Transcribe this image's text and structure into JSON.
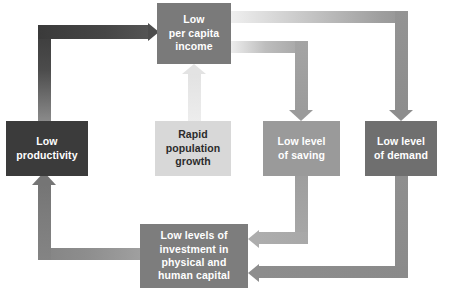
{
  "diagram": {
    "background": "#ffffff",
    "nodes": [
      {
        "id": "income",
        "label": "Low\nper capita\nincome",
        "text": "Low per capita income",
        "color": "#7a7a7a",
        "text_color": "#ffffff"
      },
      {
        "id": "productivity",
        "label": "Low\nproductivity",
        "text": "Low productivity",
        "color": "#3b3b3b",
        "text_color": "#ffffff"
      },
      {
        "id": "population",
        "label": "Rapid\npopulation\ngrowth",
        "text": "Rapid population growth",
        "color": "#d8d8d8",
        "text_color": "#2b2b2b"
      },
      {
        "id": "saving",
        "label": "Low level\nof saving",
        "text": "Low level of saving",
        "color": "#9a9a9a",
        "text_color": "#ffffff"
      },
      {
        "id": "demand",
        "label": "Low level\nof demand",
        "text": "Low level of demand",
        "color": "#6f6f6f",
        "text_color": "#ffffff"
      },
      {
        "id": "investment",
        "label": "Low levels of\ninvestment in\nphysical and\nhuman capital",
        "text": "Low levels of investment in physical and human capital",
        "color": "#7d7d7d",
        "text_color": "#ffffff"
      }
    ],
    "edges": [
      {
        "id": "a",
        "from": "productivity",
        "to": "income",
        "route": "up-then-right",
        "color": "#4d4d4d"
      },
      {
        "id": "b",
        "from": "population",
        "to": "income",
        "route": "up",
        "color": "#e3e3e3"
      },
      {
        "id": "c",
        "from": "income",
        "to": "saving",
        "route": "right-then-down",
        "color": "#9b9b9b"
      },
      {
        "id": "d",
        "from": "income",
        "to": "demand",
        "route": "right-then-down",
        "color": "#8d8d8d"
      },
      {
        "id": "e",
        "from": "saving",
        "to": "investment",
        "route": "down-then-left",
        "color": "#adadad"
      },
      {
        "id": "f",
        "from": "demand",
        "to": "investment",
        "route": "down-then-left",
        "color": "#8d8d8d"
      },
      {
        "id": "g",
        "from": "investment",
        "to": "productivity",
        "route": "left-then-up",
        "color": "#757575"
      }
    ]
  }
}
